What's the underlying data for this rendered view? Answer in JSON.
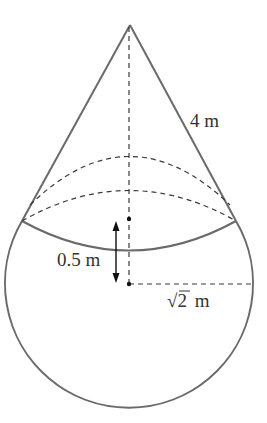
{
  "diagram": {
    "labels": {
      "slant_height": "4 m",
      "offset_distance": "0.5 m",
      "sphere_radius_sqrt": "√2",
      "sphere_radius_unit": " m"
    },
    "colors": {
      "solid_stroke": "#6a6a6a",
      "dashed_stroke": "#3a3a3a",
      "text": "#333333",
      "background": "#ffffff"
    }
  }
}
